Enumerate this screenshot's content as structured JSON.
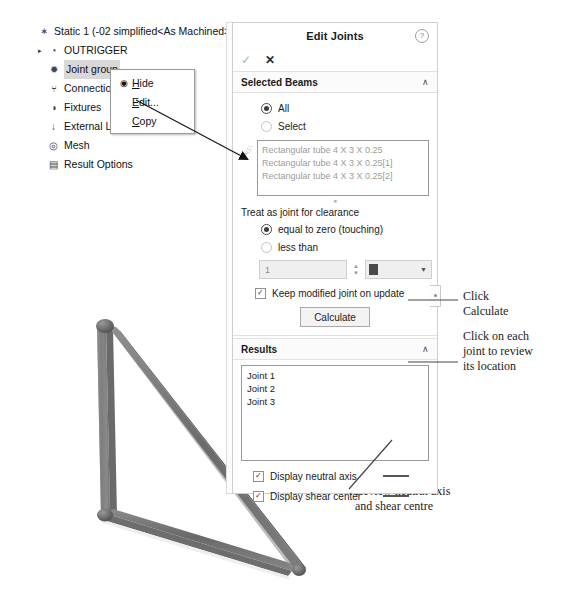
{
  "tree": {
    "items": [
      {
        "label": "Static 1 (-02 simplified<As Machined>-)",
        "icon": "study-icon",
        "indent": 0,
        "twisty": "",
        "selected": false
      },
      {
        "label": "OUTRIGGER",
        "icon": "part-icon",
        "indent": 1,
        "twisty": "▸",
        "selected": false
      },
      {
        "label": "Joint group",
        "icon": "joint-group-icon",
        "indent": 1,
        "twisty": "",
        "selected": true
      },
      {
        "label": "Connections",
        "icon": "connections-icon",
        "indent": 1,
        "twisty": "",
        "selected": false
      },
      {
        "label": "Fixtures",
        "icon": "fixtures-icon",
        "indent": 1,
        "twisty": "",
        "selected": false
      },
      {
        "label": "External Loads",
        "icon": "external-loads-icon",
        "indent": 1,
        "twisty": "",
        "selected": false
      },
      {
        "label": "Mesh",
        "icon": "mesh-icon",
        "indent": 1,
        "twisty": "",
        "selected": false
      },
      {
        "label": "Result Options",
        "icon": "result-options-icon",
        "indent": 1,
        "twisty": "",
        "selected": false
      }
    ]
  },
  "context_menu": {
    "items": [
      {
        "label": "Hide",
        "accel": "H",
        "icon": "eye-icon"
      },
      {
        "label": "Edit...",
        "accel": "E",
        "icon": ""
      },
      {
        "label": "Copy",
        "accel": "C",
        "icon": ""
      }
    ]
  },
  "panel": {
    "title": "Edit Joints",
    "help_icon": "?",
    "ok_icon": "✓",
    "cancel_icon": "✕",
    "selected_beams": {
      "header": "Selected Beams",
      "collapse_icon": "∧",
      "radio_all": "All",
      "radio_select": "Select",
      "selection_icon": "joint-select-icon",
      "beams": [
        "Rectangular tube 4 X 3 X 0.25",
        "Rectangular tube 4 X 3 X 0.25[1]",
        "Rectangular tube 4 X 3 X 0.25[2]"
      ]
    },
    "clearance": {
      "label": "Treat as joint for clearance",
      "radio_zero": "equal to zero (touching)",
      "radio_less": "less than",
      "spin_value": "1",
      "unit_value": "",
      "keep_modified": "Keep modified joint on update",
      "calculate": "Calculate"
    },
    "results": {
      "header": "Results",
      "collapse_icon": "∧",
      "joints": [
        "Joint 1",
        "Joint 2",
        "Joint 3"
      ],
      "display_neutral_axis": "Display neutral axis",
      "display_shear_center": "Display shear center"
    }
  },
  "annotations": {
    "calculate": "Click\nCalculate",
    "joints": "Click on each\njoint to review\nits location",
    "review": "Review neutral axis\nand shear centre"
  },
  "colors": {
    "beam": "#7b7b7b",
    "beam_dark": "#5a5a5a",
    "selection": "#d8d8d8",
    "panel_border": "#cfcfcf"
  }
}
